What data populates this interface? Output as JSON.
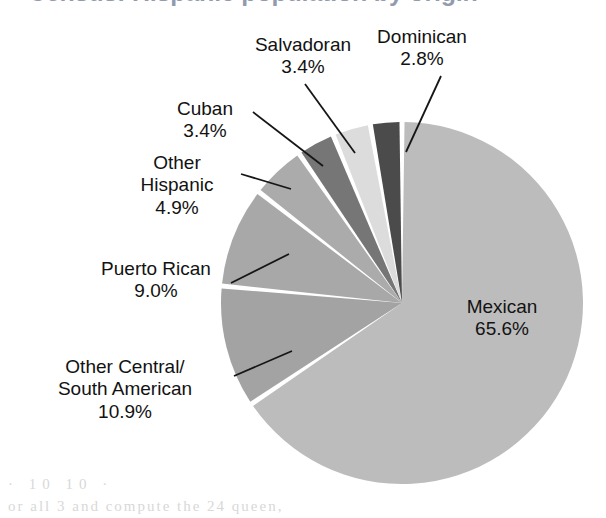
{
  "figure": {
    "title": "Census: Hispanic population by origin",
    "title_visible_partial": true,
    "background": "#ffffff",
    "bleed_text_line1": "· 10 10 ·",
    "bleed_text_line2": "or all 3 and compute the 24 queen,"
  },
  "chart_data": {
    "type": "pie",
    "title": "Census: Hispanic population by origin",
    "value_unit": "percent",
    "labels": [
      "Mexican",
      "Other Central/\nSouth American",
      "Puerto Rican",
      "Other\nHispanic",
      "Cuban",
      "Salvadoran",
      "Dominican"
    ],
    "categories": [
      "Mexican",
      "Other Central/South American",
      "Puerto Rican",
      "Other Hispanic",
      "Cuban",
      "Salvadoran",
      "Dominican"
    ],
    "values": [
      65.6,
      10.9,
      9.0,
      4.9,
      3.4,
      3.4,
      2.8
    ],
    "value_labels": [
      "65.6%",
      "10.9%",
      "9.0%",
      "4.9%",
      "3.4%",
      "3.4%",
      "2.8%"
    ],
    "colors": [
      "#bcbcbc",
      "#a3a3a3",
      "#a8a8a8",
      "#ababab",
      "#767676",
      "#dcdcdc",
      "#4b4b4b"
    ],
    "start_angle_deg": 0,
    "direction": "clockwise",
    "slice_gap_deg": 1.6,
    "legend": "none",
    "labels_position": "callouts-with-leader-lines",
    "grid": false
  },
  "geometry": {
    "center_x": 402,
    "center_y": 303,
    "radius": 181
  },
  "slices": [
    {
      "name": "Mexican",
      "label": "Mexican",
      "percent": "65.6%",
      "value": 65.6,
      "color": "#bcbcbc",
      "label_placement": "inside"
    },
    {
      "name": "Other Central/South American",
      "label_line1": "Other Central/",
      "label_line2": "South American",
      "percent": "10.9%",
      "value": 10.9,
      "color": "#a3a3a3",
      "label_placement": "outside-left"
    },
    {
      "name": "Puerto Rican",
      "label": "Puerto Rican",
      "percent": "9.0%",
      "value": 9.0,
      "color": "#a8a8a8",
      "label_placement": "outside-left"
    },
    {
      "name": "Other Hispanic",
      "label_line1": "Other",
      "label_line2": "Hispanic",
      "percent": "4.9%",
      "value": 4.9,
      "color": "#ababab",
      "label_placement": "outside-left"
    },
    {
      "name": "Cuban",
      "label": "Cuban",
      "percent": "3.4%",
      "value": 3.4,
      "color": "#767676",
      "label_placement": "outside-left"
    },
    {
      "name": "Salvadoran",
      "label": "Salvadoran",
      "percent": "3.4%",
      "value": 3.4,
      "color": "#dcdcdc",
      "label_placement": "outside-top"
    },
    {
      "name": "Dominican",
      "label": "Dominican",
      "percent": "2.8%",
      "value": 2.8,
      "color": "#4b4b4b",
      "label_placement": "outside-top"
    }
  ],
  "leader_lines": [
    {
      "name": "leader-dominican",
      "x1": 441,
      "y1": 76,
      "x2": 406,
      "y2": 152
    },
    {
      "name": "leader-salvadoran",
      "x1": 305,
      "y1": 84,
      "x2": 355,
      "y2": 153
    },
    {
      "name": "leader-cuban",
      "x1": 253,
      "y1": 112,
      "x2": 323,
      "y2": 166
    },
    {
      "name": "leader-otherhisp",
      "x1": 241,
      "y1": 174,
      "x2": 291,
      "y2": 189
    },
    {
      "name": "leader-puertorican",
      "x1": 231,
      "y1": 283,
      "x2": 289,
      "y2": 254
    },
    {
      "name": "leader-othercsa",
      "x1": 234,
      "y1": 376,
      "x2": 292,
      "y2": 351
    }
  ]
}
